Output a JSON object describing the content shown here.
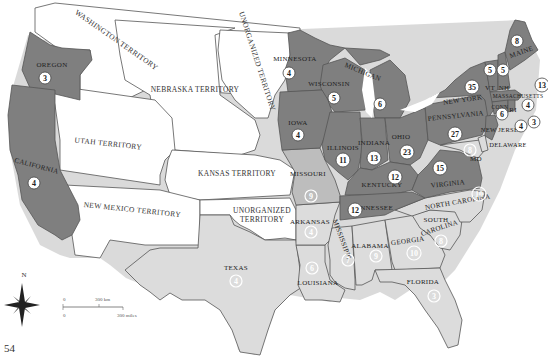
{
  "page_number": "54",
  "colors": {
    "free_state": "#7f7f7f",
    "border_state": "#bdbdbd",
    "slave_state": "#dcdcdc",
    "territory": "#ffffff",
    "outline": "#555555",
    "water_shadow": "#a8a8a8"
  },
  "territories": [
    {
      "id": "washington",
      "label": "WASHINGTON TERRITORY"
    },
    {
      "id": "nebraska",
      "label": "NEBRASKA TERRITORY"
    },
    {
      "id": "unorganized-north",
      "label": "UNORGANIZED TERRITORY"
    },
    {
      "id": "utah",
      "label": "UTAH TERRITORY"
    },
    {
      "id": "kansas",
      "label": "KANSAS TERRITORY"
    },
    {
      "id": "new-mexico",
      "label": "NEW MEXICO TERRITORY"
    },
    {
      "id": "unorganized-south",
      "label": "UNORGANIZED",
      "label2": "TERRITORY"
    }
  ],
  "states": [
    {
      "id": "oregon",
      "label": "OREGON",
      "votes": "3",
      "group": "free"
    },
    {
      "id": "california",
      "label": "CALIFORNIA",
      "votes": "4",
      "group": "free"
    },
    {
      "id": "minnesota",
      "label": "MINNESOTA",
      "votes": "4",
      "group": "free"
    },
    {
      "id": "wisconsin",
      "label": "WISCONSIN",
      "votes": "5",
      "group": "free"
    },
    {
      "id": "michigan",
      "label": "MICHIGAN",
      "votes": "6",
      "group": "free"
    },
    {
      "id": "iowa",
      "label": "IOWA",
      "votes": "4",
      "group": "free"
    },
    {
      "id": "illinois",
      "label": "ILLINOIS",
      "votes": "11",
      "group": "free"
    },
    {
      "id": "indiana",
      "label": "INDIANA",
      "votes": "13",
      "group": "free"
    },
    {
      "id": "ohio",
      "label": "OHIO",
      "votes": "23",
      "group": "free"
    },
    {
      "id": "pennsylvania",
      "label": "PENNSYLVANIA",
      "votes": "27",
      "group": "free"
    },
    {
      "id": "new-york",
      "label": "NEW YORK",
      "votes": "35",
      "group": "free"
    },
    {
      "id": "vermont",
      "label": "VT",
      "votes": "5",
      "group": "free"
    },
    {
      "id": "new-hampshire",
      "label": "NH",
      "votes": "5",
      "group": "free"
    },
    {
      "id": "maine",
      "label": "MAINE",
      "votes": "8",
      "group": "free"
    },
    {
      "id": "massachusetts",
      "label": "MASSACHUSETTS",
      "votes": "13",
      "group": "free"
    },
    {
      "id": "connecticut",
      "label": "CONN",
      "votes": "6",
      "group": "free"
    },
    {
      "id": "rhode-island",
      "label": "RI",
      "votes": "4",
      "group": "free"
    },
    {
      "id": "new-jersey",
      "label": "NEW JERSEY",
      "votes": "4",
      "votes2": "3",
      "group": "free"
    },
    {
      "id": "delaware",
      "label": "DELAWARE",
      "votes": "3",
      "group": "slave"
    },
    {
      "id": "maryland",
      "label": "MD",
      "votes": "8",
      "group": "slave"
    },
    {
      "id": "virginia",
      "label": "VIRGINIA",
      "votes": "15",
      "group": "free"
    },
    {
      "id": "kentucky",
      "label": "KENTUCKY",
      "votes": "12",
      "group": "free"
    },
    {
      "id": "tennessee",
      "label": "TENNESSEE",
      "votes": "12",
      "group": "free"
    },
    {
      "id": "missouri",
      "label": "MISSOURI",
      "votes": "9",
      "group": "border"
    },
    {
      "id": "arkansas",
      "label": "ARKANSAS",
      "votes": "4",
      "group": "slave"
    },
    {
      "id": "louisiana",
      "label": "LOUISIANA",
      "votes": "6",
      "group": "slave"
    },
    {
      "id": "mississippi",
      "label": "MISSISSIPPI",
      "votes": "7",
      "group": "slave"
    },
    {
      "id": "alabama",
      "label": "ALABAMA",
      "votes": "9",
      "group": "slave"
    },
    {
      "id": "georgia",
      "label": "GEORGIA",
      "votes": "10",
      "group": "slave"
    },
    {
      "id": "north-carolina",
      "label": "NORTH CAROLINA",
      "votes": "10",
      "group": "slave"
    },
    {
      "id": "south-carolina",
      "label": "SOUTH",
      "label2": "CAROLINA",
      "votes": "8",
      "group": "slave"
    },
    {
      "id": "florida",
      "label": "FLORIDA",
      "votes": "3",
      "group": "slave"
    },
    {
      "id": "texas",
      "label": "TEXAS",
      "votes": "4",
      "group": "slave"
    }
  ],
  "compass": {
    "north_label": "N"
  },
  "scale": {
    "km_zero": "0",
    "km_label": "300 km",
    "mi_zero": "0",
    "mi_label": "300 miles"
  }
}
